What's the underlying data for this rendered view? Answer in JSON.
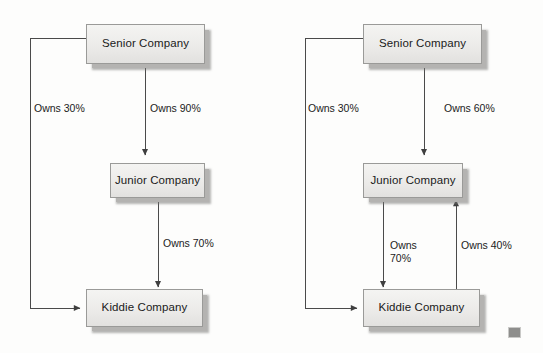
{
  "figure": {
    "type": "diagram",
    "kind": "ownership-structure",
    "background_color": "#fdfdfc",
    "panel_count": 2
  },
  "panels": [
    {
      "id": "left",
      "name": "left-ownership-diagram",
      "nodes": [
        {
          "id": "senior",
          "label": "Senior Company"
        },
        {
          "id": "junior",
          "label": "Junior Company"
        },
        {
          "id": "kiddie",
          "label": "Kiddie Company"
        }
      ],
      "edges": [
        {
          "id": "senior-junior",
          "from": "Senior Company",
          "to": "Junior Company",
          "label": "Owns 90%",
          "percent": 90
        },
        {
          "id": "junior-kiddie",
          "from": "Junior Company",
          "to": "Kiddie Company",
          "label": "Owns 70%",
          "percent": 70
        },
        {
          "id": "senior-kiddie",
          "from": "Senior Company",
          "to": "Kiddie Company",
          "label": "Owns 30%",
          "percent": 30
        }
      ]
    },
    {
      "id": "right",
      "name": "right-ownership-diagram",
      "nodes": [
        {
          "id": "senior",
          "label": "Senior Company"
        },
        {
          "id": "junior",
          "label": "Junior Company"
        },
        {
          "id": "kiddie",
          "label": "Kiddie Company"
        }
      ],
      "edges": [
        {
          "id": "senior-junior",
          "from": "Senior Company",
          "to": "Junior Company",
          "label": "Owns 60%",
          "percent": 60
        },
        {
          "id": "junior-kiddie",
          "from": "Junior Company",
          "to": "Kiddie Company",
          "label": "Owns\n70%",
          "percent": 70
        },
        {
          "id": "kiddie-junior",
          "from": "Kiddie Company",
          "to": "Junior Company",
          "label": "Owns 40%",
          "percent": 40
        },
        {
          "id": "senior-kiddie",
          "from": "Senior Company",
          "to": "Kiddie Company",
          "label": "Owns 30%",
          "percent": 30
        }
      ]
    }
  ],
  "colors": {
    "box_fill": "#ecebe9",
    "box_border": "#9a9a98",
    "box_shadow": "#b4b3b1",
    "line": "#4a4a4a",
    "text": "#1a1a1a",
    "corner_mark": "#8e8e8c"
  }
}
